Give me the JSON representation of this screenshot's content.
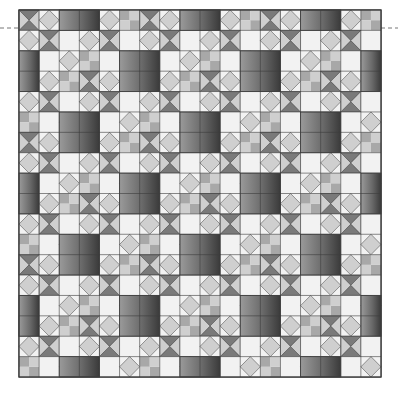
{
  "canvas": {
    "width": 398,
    "height": 394,
    "background": "#ffffff"
  },
  "quilt": {
    "x": 19,
    "y": 10,
    "width": 362,
    "height": 367,
    "unit_x": 20.11,
    "unit_y": 20.39,
    "cols": 18,
    "rows": 18,
    "colors": {
      "light": "#f2f2f2",
      "medium": "#cfcfcf",
      "mid_dark": "#a8a8a8",
      "dark": "#7a7a7a",
      "line": "#3c3c3c",
      "gradient_light": "#9a9a9a",
      "gradient_dark": "#3a3a3a"
    },
    "gradient_squares": [
      {
        "c": 2,
        "r": 0,
        "w": 2,
        "h": 1
      },
      {
        "c": 8,
        "r": 0,
        "w": 2,
        "h": 1
      },
      {
        "c": 14,
        "r": 0,
        "w": 2,
        "h": 1
      },
      {
        "c": 0,
        "r": 2,
        "w": 1,
        "h": 2
      },
      {
        "c": 5,
        "r": 2,
        "w": 2,
        "h": 2
      },
      {
        "c": 11,
        "r": 2,
        "w": 2,
        "h": 2
      },
      {
        "c": 17,
        "r": 2,
        "w": 1,
        "h": 2
      },
      {
        "c": 2,
        "r": 5,
        "w": 2,
        "h": 2
      },
      {
        "c": 8,
        "r": 5,
        "w": 2,
        "h": 2
      },
      {
        "c": 14,
        "r": 5,
        "w": 2,
        "h": 2
      },
      {
        "c": 0,
        "r": 8,
        "w": 1,
        "h": 2
      },
      {
        "c": 5,
        "r": 8,
        "w": 2,
        "h": 2
      },
      {
        "c": 11,
        "r": 8,
        "w": 2,
        "h": 2
      },
      {
        "c": 17,
        "r": 8,
        "w": 1,
        "h": 2
      },
      {
        "c": 2,
        "r": 11,
        "w": 2,
        "h": 2
      },
      {
        "c": 8,
        "r": 11,
        "w": 2,
        "h": 2
      },
      {
        "c": 14,
        "r": 11,
        "w": 2,
        "h": 2
      },
      {
        "c": 0,
        "r": 14,
        "w": 1,
        "h": 2
      },
      {
        "c": 5,
        "r": 14,
        "w": 2,
        "h": 2
      },
      {
        "c": 11,
        "r": 14,
        "w": 2,
        "h": 2
      },
      {
        "c": 17,
        "r": 14,
        "w": 1,
        "h": 2
      },
      {
        "c": 2,
        "r": 17,
        "w": 2,
        "h": 1
      },
      {
        "c": 8,
        "r": 17,
        "w": 2,
        "h": 1
      },
      {
        "c": 14,
        "r": 17,
        "w": 2,
        "h": 1
      }
    ]
  },
  "guide_line": {
    "y": 28,
    "left": [
      0,
      19
    ],
    "right": [
      381,
      398
    ],
    "color": "#777777",
    "dash": "4 3"
  }
}
